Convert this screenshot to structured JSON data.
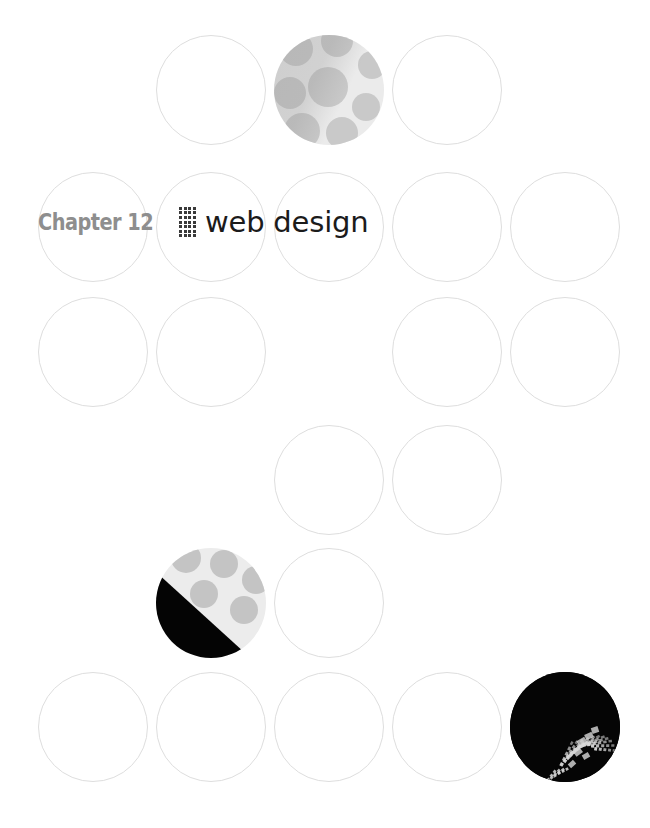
{
  "page": {
    "width": 650,
    "height": 828,
    "background": "#ffffff",
    "kind": "book-chapter-opener"
  },
  "title": {
    "chapter_label": "Chapter 12",
    "separator": "dot-grid",
    "chapter_title": "web design",
    "label_color": "#8e8e8e",
    "title_color": "#1b1b1b",
    "separator_color": "#3a3a3a"
  },
  "decoration": {
    "shape": "circle",
    "diameter": 110,
    "outline_color": "#dedede",
    "grid": {
      "columns": 5,
      "rows": 6,
      "column_x": [
        38,
        156,
        274,
        392,
        510
      ],
      "row_y": [
        35,
        172,
        297,
        425,
        548,
        672
      ]
    },
    "palette": {
      "dot_fill": "#c9c9c9",
      "dot_background": "#ebebeb",
      "black": "#040404",
      "photo_background": "#050505",
      "photo_highlight": "#d8d8d8"
    },
    "circles": [
      {
        "name": "circle-r1c2",
        "row": 0,
        "col": 1,
        "style": "outline"
      },
      {
        "name": "circle-r1c3",
        "row": 0,
        "col": 2,
        "style": "dots"
      },
      {
        "name": "circle-r1c4",
        "row": 0,
        "col": 3,
        "style": "outline"
      },
      {
        "name": "circle-r2c1",
        "row": 1,
        "col": 0,
        "style": "outline"
      },
      {
        "name": "circle-r2c2",
        "row": 1,
        "col": 1,
        "style": "outline"
      },
      {
        "name": "circle-r2c3",
        "row": 1,
        "col": 2,
        "style": "outline"
      },
      {
        "name": "circle-r2c4",
        "row": 1,
        "col": 3,
        "style": "outline"
      },
      {
        "name": "circle-r2c5",
        "row": 1,
        "col": 4,
        "style": "outline"
      },
      {
        "name": "circle-r3c1",
        "row": 2,
        "col": 0,
        "style": "outline"
      },
      {
        "name": "circle-r3c2",
        "row": 2,
        "col": 1,
        "style": "outline"
      },
      {
        "name": "circle-r3c4",
        "row": 2,
        "col": 3,
        "style": "outline"
      },
      {
        "name": "circle-r3c5",
        "row": 2,
        "col": 4,
        "style": "outline"
      },
      {
        "name": "circle-r4c3",
        "row": 3,
        "col": 2,
        "style": "outline"
      },
      {
        "name": "circle-r4c4",
        "row": 3,
        "col": 3,
        "style": "outline"
      },
      {
        "name": "circle-r5c2",
        "row": 4,
        "col": 1,
        "style": "split"
      },
      {
        "name": "circle-r5c3",
        "row": 4,
        "col": 2,
        "style": "outline"
      },
      {
        "name": "circle-r6c1",
        "row": 5,
        "col": 0,
        "style": "outline"
      },
      {
        "name": "circle-r6c2",
        "row": 5,
        "col": 1,
        "style": "outline"
      },
      {
        "name": "circle-r6c3",
        "row": 5,
        "col": 2,
        "style": "outline"
      },
      {
        "name": "circle-r6c4",
        "row": 5,
        "col": 3,
        "style": "outline"
      },
      {
        "name": "circle-r6c5",
        "row": 5,
        "col": 4,
        "style": "photo",
        "subject": "butterfly-wing"
      }
    ],
    "dot_pattern_top": [
      {
        "cx": 22,
        "cy": 14,
        "r": 17
      },
      {
        "cx": 63,
        "cy": 6,
        "r": 16
      },
      {
        "cx": 98,
        "cy": 30,
        "r": 14
      },
      {
        "cx": 16,
        "cy": 58,
        "r": 16
      },
      {
        "cx": 54,
        "cy": 52,
        "r": 20
      },
      {
        "cx": 92,
        "cy": 72,
        "r": 14
      },
      {
        "cx": 28,
        "cy": 96,
        "r": 18
      },
      {
        "cx": 68,
        "cy": 98,
        "r": 16
      },
      {
        "cx": 104,
        "cy": 104,
        "r": 13
      }
    ],
    "dot_pattern_split": [
      {
        "cx": 30,
        "cy": 10,
        "r": 15
      },
      {
        "cx": 68,
        "cy": 16,
        "r": 14
      },
      {
        "cx": 100,
        "cy": 32,
        "r": 14
      },
      {
        "cx": 48,
        "cy": 46,
        "r": 14
      },
      {
        "cx": 88,
        "cy": 62,
        "r": 14
      }
    ]
  }
}
